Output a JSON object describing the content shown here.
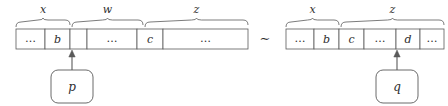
{
  "figure": {
    "relation_symbol": "∼",
    "left_structure": {
      "name": "left-sequence",
      "braces": [
        {
          "label": "x",
          "x1": 16,
          "x2": 70
        },
        {
          "label": "w",
          "x1": 72,
          "x2": 143
        },
        {
          "label": "z",
          "x1": 145,
          "x2": 248
        }
      ],
      "cells": [
        {
          "text": "…",
          "x1": 16,
          "x2": 45
        },
        {
          "text": "b",
          "x1": 45,
          "x2": 70
        },
        {
          "text": "",
          "x1": 70,
          "x2": 87
        },
        {
          "text": "…",
          "x1": 87,
          "x2": 137
        },
        {
          "text": "c",
          "x1": 137,
          "x2": 163
        },
        {
          "text": "…",
          "x1": 163,
          "x2": 248
        }
      ],
      "pointer": {
        "label": "p",
        "target_x": 72
      }
    },
    "right_structure": {
      "name": "right-sequence",
      "braces": [
        {
          "label": "x",
          "x1": 286,
          "x2": 339
        },
        {
          "label": "z",
          "x1": 341,
          "x2": 444
        }
      ],
      "cells": [
        {
          "text": "…",
          "x1": 286,
          "x2": 314
        },
        {
          "text": "b",
          "x1": 314,
          "x2": 339
        },
        {
          "text": "c",
          "x1": 339,
          "x2": 364
        },
        {
          "text": "…",
          "x1": 364,
          "x2": 396
        },
        {
          "text": "d",
          "x1": 396,
          "x2": 420
        },
        {
          "text": "…",
          "x1": 420,
          "x2": 444
        }
      ],
      "pointer": {
        "label": "q",
        "target_x": 397
      }
    }
  },
  "colors": {
    "stroke": "#5a5a5a",
    "text": "#2e2e2e",
    "background": "#ffffff"
  }
}
